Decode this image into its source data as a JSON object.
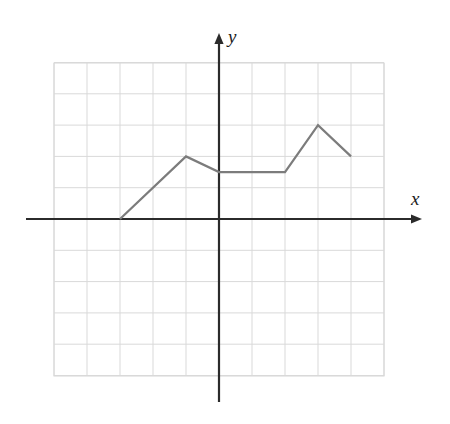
{
  "figure": {
    "kind": "coordinate-grid-line-graph",
    "background_color": "#ffffff",
    "grid_color": "#d9d9d9",
    "grid_minor_color": "#e6e6e6",
    "axis_color": "#2b2b2b",
    "curve_color": "#7c7c7c",
    "curve_width": 2.2,
    "axis_width": 2.2,
    "x_axis_label": "x",
    "y_axis_label": "y"
  },
  "chart_data": {
    "type": "line",
    "title": "",
    "xlabel": "x",
    "ylabel": "y",
    "grid": true,
    "legend": "none",
    "xlim": [
      -5,
      5
    ],
    "ylim": [
      -5,
      5
    ],
    "xticks": [
      -5,
      -4,
      -3,
      -2,
      -1,
      0,
      1,
      2,
      3,
      4,
      5
    ],
    "yticks": [
      -5,
      -4,
      -3,
      -2,
      -1,
      0,
      1,
      2,
      3,
      4,
      5
    ],
    "xtick_labels": [],
    "ytick_labels": [],
    "series": [
      {
        "name": "piecewise-linear-curve",
        "color": "#7c7c7c",
        "x": [
          -3,
          -1,
          0,
          2,
          3,
          4
        ],
        "y": [
          0,
          2,
          1.5,
          1.5,
          3,
          2
        ],
        "points": [
          {
            "x": -3,
            "y": 0
          },
          {
            "x": -1,
            "y": 2
          },
          {
            "x": 0,
            "y": 1.5
          },
          {
            "x": 2,
            "y": 1.5
          },
          {
            "x": 3,
            "y": 3
          },
          {
            "x": 4,
            "y": 2
          }
        ]
      }
    ]
  },
  "geometry": {
    "grid_left_px": 54,
    "grid_right_px": 384,
    "grid_top_px": 63,
    "grid_bottom_px": 376,
    "origin_x_px": 219,
    "origin_y_px": 219,
    "cell_width_px": 33,
    "cell_height_px": 31.3,
    "x_axis_start_px": 26,
    "x_axis_end_px": 422,
    "y_axis_top_px": 33,
    "y_axis_bottom_px": 402
  }
}
